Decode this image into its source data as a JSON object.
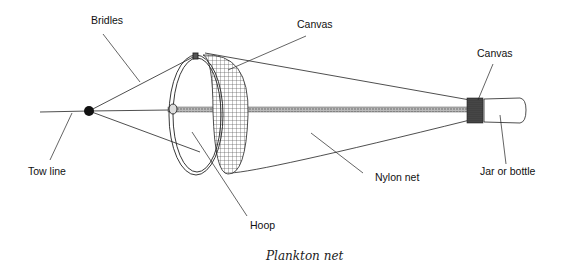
{
  "figure": {
    "caption": "Plankton net",
    "labels": {
      "bridles": "Bridles",
      "canvas_hoop": "Canvas",
      "canvas_jar": "Canvas",
      "tow_line": "Tow line",
      "hoop": "Hoop",
      "nylon_net": "Nylon net",
      "jar": "Jar or bottle"
    },
    "colors": {
      "line": "#222222",
      "background": "#ffffff"
    }
  }
}
